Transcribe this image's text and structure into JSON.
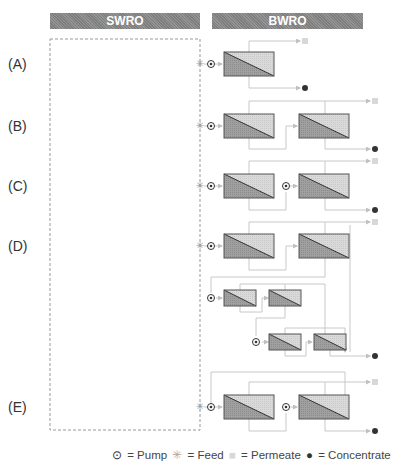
{
  "headers": {
    "left": "SWRO",
    "right": "BWRO"
  },
  "rows": [
    {
      "label": "(A)",
      "y": 64
    },
    {
      "label": "(B)",
      "y": 126
    },
    {
      "label": "(C)",
      "y": 186
    },
    {
      "label": "(D)",
      "y": 246
    },
    {
      "label": "(E)",
      "y": 407
    }
  ],
  "legend": {
    "pump_symbol": "⊙",
    "pump": "= Pump",
    "feed_symbol": "✳",
    "feed": "= Feed",
    "permeate_symbol": "■",
    "permeate": "= Permeate",
    "concentrate_symbol": "●",
    "concentrate": "= Concentrate"
  },
  "colors": {
    "header": "#8a8a8a",
    "module_dark": "#9a9a9a",
    "module_light": "#d4d4d4",
    "line": "#c8c8c8",
    "concentrate": "#333333",
    "permeate": "#d8d8d8"
  }
}
